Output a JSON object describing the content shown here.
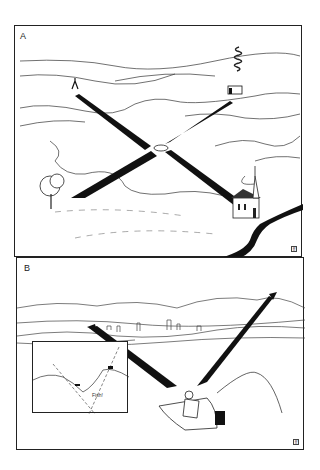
{
  "figure": {
    "panels": [
      {
        "label": "A",
        "description": "Landscape with lake; boat at center with two sight-lines crossing: tree to church, tripod tower to house with chimney smoke",
        "landmarks": [
          "tree",
          "church",
          "tripod-marker",
          "house-with-smoke",
          "boat",
          "stream"
        ],
        "corner_mark": "ff"
      },
      {
        "label": "B",
        "description": "Fisherman in rowboat sighting two shoreline landmarks with arrows; fishing line cast to right",
        "landmarks": [
          "shoreline-town",
          "pier",
          "mountain-peak",
          "fisherman",
          "rowboat",
          "outboard-motor"
        ],
        "corner_mark": "ff",
        "inset": {
          "annotation": "Fish!",
          "description": "Map inset showing two dashed sight-lines intersecting at fish location"
        }
      }
    ]
  },
  "colors": {
    "ink": "#1a1a1a",
    "background": "#ffffff"
  }
}
